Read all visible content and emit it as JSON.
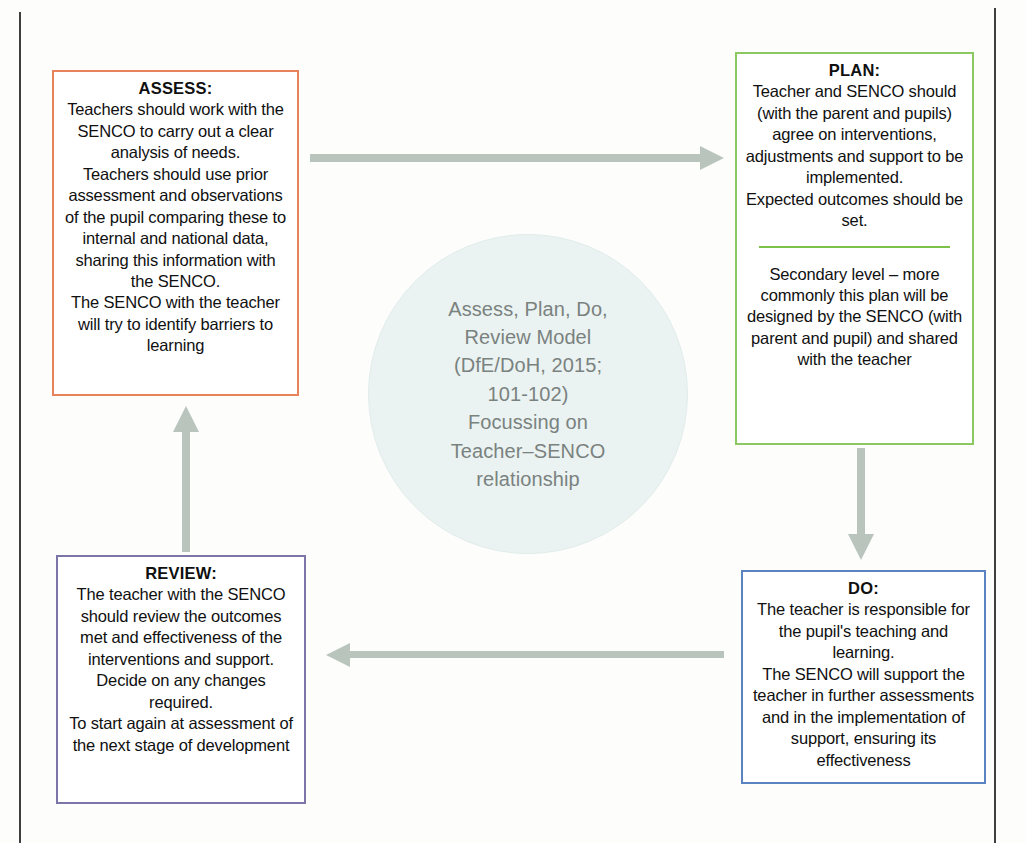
{
  "diagram": {
    "centre": {
      "text": "Assess, Plan, Do,\nReview Model\n(DfE/DoH, 2015;\n101-102)\nFocussing on\nTeacher–SENCO\nrelationship",
      "fill_color": "#eaf3f2",
      "text_color": "#7a8280"
    },
    "boxes": {
      "assess": {
        "title": "ASSESS:",
        "body": "Teachers should work with the SENCO to carry out a clear analysis of needs.\nTeachers should use prior assessment and observations of the pupil comparing these to internal and national data,  sharing this information with the SENCO.\nThe SENCO with the teacher will try to identify barriers to learning",
        "border_color": "#e8825b"
      },
      "plan": {
        "title": "PLAN:",
        "body_top": "Teacher and SENCO should (with the parent and pupils) agree on interventions, adjustments and support to be implemented.\nExpected outcomes should be set.",
        "body_bottom": "Secondary level – more commonly this plan will be designed by the SENCO (with parent and pupil) and shared with the teacher",
        "border_color": "#8cc861",
        "divider_color": "#7cc24a"
      },
      "do": {
        "title": "DO:",
        "body": "The teacher is responsible for the pupil's teaching and learning.\nThe SENCO will support the teacher in further assessments and in the implementation of support, ensuring its effectiveness",
        "border_color": "#5b83c2"
      },
      "review": {
        "title": "REVIEW:",
        "body": "The teacher with the SENCO should review the outcomes met and effectiveness of the interventions and support.\nDecide on any changes required.\nTo start again at assessment of the next stage of development",
        "border_color": "#7c76a8"
      }
    },
    "arrows": {
      "color": "#b9c4bd",
      "assess_to_plan": "assess-to-plan",
      "plan_to_do": "plan-to-do",
      "do_to_review": "do-to-review",
      "review_to_assess": "review-to-assess"
    }
  }
}
